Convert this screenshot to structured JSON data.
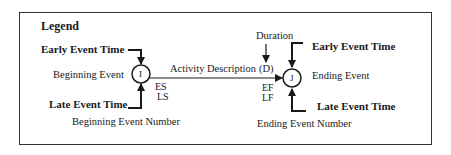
{
  "legend": {
    "title": "Legend",
    "start_node": {
      "id_label": "I",
      "early_time_label": "Early  Event Time",
      "late_time_label": "Late Event Time",
      "event_label": "Beginning Event",
      "number_label": "Beginning Event Number",
      "es_label": "ES",
      "ls_label": "LS"
    },
    "activity": {
      "description_label": "Activity Description",
      "duration_label": "Duration",
      "duration_symbol": "(D)"
    },
    "end_node": {
      "id_label": "J",
      "early_time_label": "Early  Event Time",
      "late_time_label": "Late Event Time",
      "event_label": "Ending Event",
      "number_label": "Ending Event Number",
      "ef_label": "EF",
      "lf_label": "LF"
    }
  },
  "colors": {
    "stroke": "#1a1a1a",
    "background": "#ffffff"
  }
}
